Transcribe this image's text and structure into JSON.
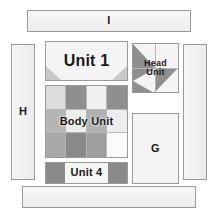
{
  "diagram": {
    "background": "#ffffff",
    "outline_color": "#9a9a9a"
  },
  "palette": {
    "light": "#f2f2f2",
    "lighter": "#f7f7f7",
    "white": "#fbfbfb",
    "mid_light": "#d7d7d7",
    "mid": "#bdbdbd",
    "dark": "#8f8f8f",
    "darker": "#7e7e7e",
    "grid_line": "#b8b8b8",
    "text": "#1a1a1a"
  },
  "pieces": {
    "bar_top": {
      "label": "I",
      "fill": "#f2f2f2"
    },
    "bar_bottom": {
      "label": "",
      "fill": "#f2f2f2"
    },
    "strip_left": {
      "label": "H",
      "fill": "#f2f2f2"
    },
    "strip_right": {
      "label": "",
      "fill": "#f2f2f2"
    },
    "unit_1": {
      "label": "Unit 1",
      "fill": "#f4f4f4",
      "corner_fill": "#c9c9c9"
    },
    "head_unit": {
      "label": "Head\nUnit",
      "fill": "#f4f4f4",
      "accent_fill": "#8f8f8f"
    },
    "body_unit": {
      "label": "Body Unit",
      "fill": "#f2f2f2"
    },
    "unit_4": {
      "label": "Unit 4",
      "fill": "#f7f7f7"
    },
    "block_g": {
      "label": "G",
      "fill": "#f4f4f4"
    }
  },
  "body_unit_grid": {
    "rows": 3,
    "cols": 4,
    "cells": [
      [
        "#dcdcdc",
        "#8f8f8f",
        "#f0f0f0",
        "#8f8f8f"
      ],
      [
        "#b5b5b5",
        "#ededed",
        "#b0b0b0",
        "#ededed"
      ],
      [
        "#a8a8a8",
        "#8a8a8a",
        "#9e9e9e",
        "#fbfbfb"
      ]
    ]
  },
  "unit_4_segments": [
    {
      "fill": "#8a8a8a",
      "width_pct": 24
    },
    {
      "fill": "#f5f5f5",
      "width_pct": 52
    },
    {
      "fill": "#8a8a8a",
      "width_pct": 24
    }
  ]
}
